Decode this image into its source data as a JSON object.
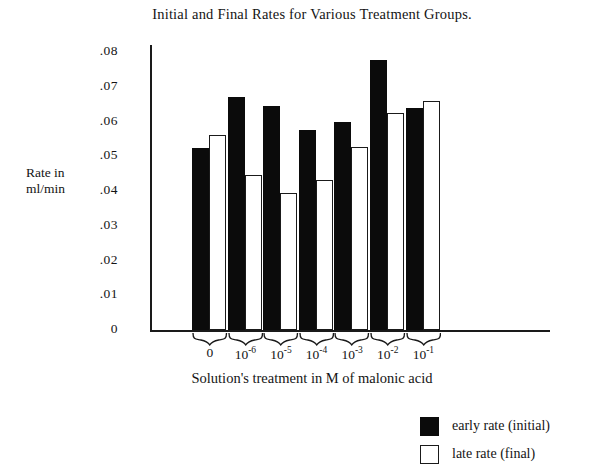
{
  "chart_data": {
    "type": "bar",
    "title": "Initial and Final Rates for Various Treatment Groups.",
    "xlabel": "Solution's treatment in M of malonic acid",
    "ylabel": "Rate in\nml/min",
    "ylabel_line1": "Rate in",
    "ylabel_line2": "ml/min",
    "categories": [
      "0",
      "10-6",
      "10-5",
      "10-4",
      "10-3",
      "10-2",
      "10-1"
    ],
    "category_labels": [
      {
        "base": "0",
        "exp": ""
      },
      {
        "base": "10",
        "exp": "-6"
      },
      {
        "base": "10",
        "exp": "-5"
      },
      {
        "base": "10",
        "exp": "-4"
      },
      {
        "base": "10",
        "exp": "-3"
      },
      {
        "base": "10",
        "exp": "-2"
      },
      {
        "base": "10",
        "exp": "-1"
      }
    ],
    "series": [
      {
        "name": "early rate (initial)",
        "color": "#0b0b0b",
        "values": [
          0.0525,
          0.067,
          0.0645,
          0.0576,
          0.0599,
          0.0777,
          0.0639
        ]
      },
      {
        "name": "late rate (final)",
        "color": "#ffffff",
        "values": [
          0.056,
          0.0446,
          0.0394,
          0.0432,
          0.0527,
          0.0624,
          0.0659
        ]
      }
    ],
    "ylim": [
      0,
      0.08
    ],
    "yticks": [
      0.08,
      0.07,
      0.06,
      0.05,
      0.04,
      0.03,
      0.02,
      0.01,
      0
    ],
    "ytick_labels": [
      ".08",
      ".07",
      ".06",
      ".05",
      ".04",
      ".03",
      ".02",
      ".01",
      "0"
    ],
    "grid": false,
    "legend_position": "bottom-right"
  },
  "legend": {
    "items": [
      {
        "label": "early rate (initial)",
        "style": "dark"
      },
      {
        "label": "late rate (final)",
        "style": "light"
      }
    ]
  }
}
